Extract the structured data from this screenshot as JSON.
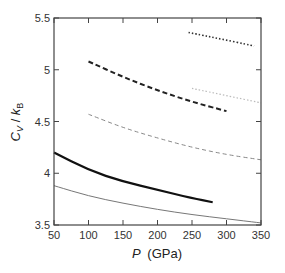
{
  "chart_data": {
    "type": "line",
    "title": "",
    "xlabel": "P (GPa)",
    "ylabel": "Cv / kB",
    "xlim": [
      50,
      350
    ],
    "ylim": [
      3.5,
      5.5
    ],
    "xticks": [
      50,
      100,
      150,
      200,
      250,
      300,
      350
    ],
    "yticks": [
      3.5,
      4,
      4.5,
      5,
      5.5
    ],
    "xtick_labels": [
      "50",
      "100",
      "150",
      "200",
      "250",
      "300",
      "350"
    ],
    "ytick_labels": [
      "3.5",
      "4",
      "4.5",
      "5",
      "5.5"
    ],
    "grid": false,
    "legend": null,
    "series": [
      {
        "name": "dotted-dark",
        "style": "dotted",
        "color": "#333333",
        "width": 1.6,
        "x": [
          245,
          290,
          340
        ],
        "y": [
          5.36,
          5.3,
          5.23
        ]
      },
      {
        "name": "dashed-thick-dark",
        "style": "dashed",
        "color": "#222222",
        "width": 2,
        "x": [
          100,
          150,
          200,
          250,
          300
        ],
        "y": [
          5.08,
          4.93,
          4.8,
          4.69,
          4.6
        ]
      },
      {
        "name": "dotted-light",
        "style": "dotted",
        "color": "#bbbbbb",
        "width": 1.2,
        "x": [
          250,
          300,
          350
        ],
        "y": [
          4.82,
          4.75,
          4.68
        ]
      },
      {
        "name": "dashed-thin-gray",
        "style": "dashed",
        "color": "#888888",
        "width": 1,
        "x": [
          100,
          150,
          200,
          250,
          300,
          350
        ],
        "y": [
          4.57,
          4.44,
          4.34,
          4.25,
          4.18,
          4.13
        ]
      },
      {
        "name": "solid-thick-dark",
        "style": "solid",
        "color": "#111111",
        "width": 2.2,
        "x": [
          50,
          100,
          150,
          200,
          250,
          280
        ],
        "y": [
          4.2,
          4.03,
          3.92,
          3.84,
          3.76,
          3.72
        ]
      },
      {
        "name": "solid-thin-gray",
        "style": "solid",
        "color": "#777777",
        "width": 1,
        "x": [
          50,
          100,
          150,
          200,
          250,
          300,
          350
        ],
        "y": [
          3.88,
          3.78,
          3.71,
          3.65,
          3.6,
          3.56,
          3.52
        ]
      }
    ]
  },
  "axes": {
    "x_label_main": "P",
    "x_label_unit": "(GPa)",
    "y_label_c": "C",
    "y_label_v": "V",
    "y_label_sep": " / ",
    "y_label_k": "k",
    "y_label_b": "B"
  },
  "plot_box": {
    "left": 54,
    "right": 261,
    "top": 18,
    "bottom": 225
  }
}
